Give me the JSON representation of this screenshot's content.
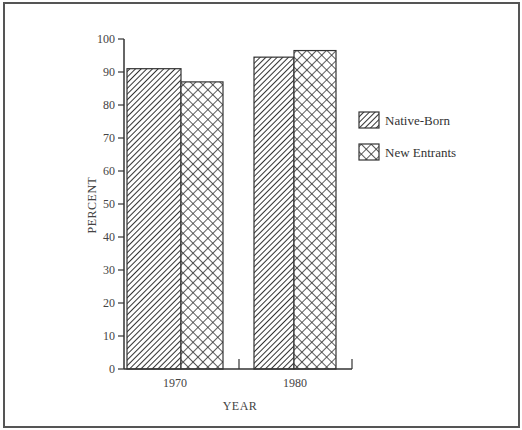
{
  "chart_data": {
    "type": "bar",
    "title": "",
    "xlabel": "YEAR",
    "ylabel": "PERCENT",
    "ylim": [
      0,
      100
    ],
    "yticks": [
      0,
      10,
      20,
      30,
      40,
      50,
      60,
      70,
      80,
      90,
      100
    ],
    "ytick_labels": [
      "0",
      "10",
      "20",
      "30",
      "40",
      "50",
      "60",
      "70",
      "80",
      "90",
      "100"
    ],
    "categories": [
      "1970",
      "1980"
    ],
    "series": [
      {
        "name": "Native-Born",
        "pattern": "diagonal-hatch",
        "values": [
          91,
          94.5
        ]
      },
      {
        "name": "New Entrants",
        "pattern": "crosshatch",
        "values": [
          87,
          96.5
        ]
      }
    ],
    "grid": false,
    "legend_position": "right"
  },
  "legend": {
    "items": [
      {
        "label": "Native-Born"
      },
      {
        "label": "New Entrants"
      }
    ]
  },
  "colors": {
    "ink": "#333333",
    "frame": "#555555",
    "background": "#ffffff"
  }
}
